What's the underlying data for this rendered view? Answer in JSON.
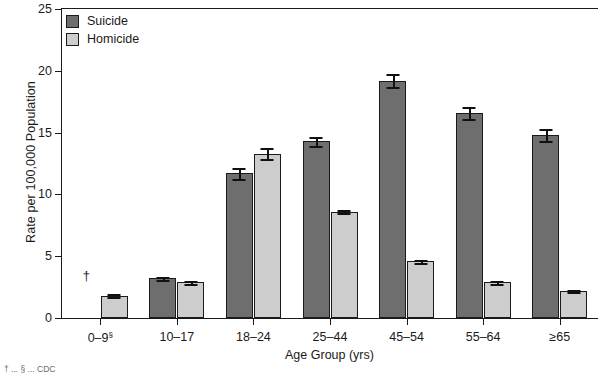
{
  "chart_data": {
    "type": "bar",
    "title": "",
    "xlabel": "Age Group (yrs)",
    "ylabel": "Rate per 100,000 Population",
    "ylim": [
      0,
      25
    ],
    "yticks": [
      0,
      5,
      10,
      15,
      20,
      25
    ],
    "grid": false,
    "legend_position": "top-left",
    "categories": [
      "0–9§",
      "10–17",
      "18–24",
      "25–44",
      "45–54",
      "55–64",
      "≥65"
    ],
    "series": [
      {
        "name": "Suicide",
        "color": "#6e6e6e",
        "values": [
          null,
          3.2,
          11.7,
          14.3,
          19.2,
          16.6,
          14.8
        ],
        "errors": [
          null,
          0.15,
          0.45,
          0.35,
          0.55,
          0.5,
          0.5
        ]
      },
      {
        "name": "Homicide",
        "color": "#cdcdcd",
        "values": [
          1.8,
          2.9,
          13.3,
          8.6,
          4.6,
          2.9,
          2.2
        ],
        "errors": [
          0.12,
          0.12,
          0.45,
          0.12,
          0.12,
          0.12,
          0.1
        ]
      }
    ],
    "annotations": [
      {
        "text": "†",
        "category_index": 0,
        "series": "Suicide",
        "value": 2.9
      }
    ]
  },
  "legend": {
    "items": [
      {
        "label": "Suicide"
      },
      {
        "label": "Homicide"
      }
    ]
  },
  "footnote": {
    "text": "† ... § ... CDC"
  }
}
